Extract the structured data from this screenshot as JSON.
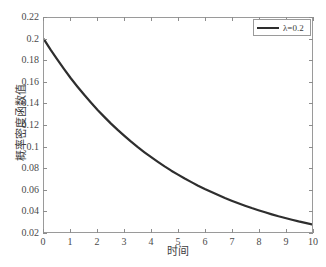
{
  "chart_data": {
    "type": "line",
    "title": "",
    "xlabel": "时间",
    "ylabel": "概率密度函数值",
    "xlim": [
      0,
      10
    ],
    "ylim": [
      0.02,
      0.22
    ],
    "grid": false,
    "legend_position": "top-right",
    "x_ticks": [
      "0",
      "1",
      "2",
      "3",
      "4",
      "5",
      "6",
      "7",
      "8",
      "9",
      "10"
    ],
    "y_ticks": [
      "0.02",
      "0.04",
      "0.06",
      "0.08",
      "0.1",
      "0.12",
      "0.14",
      "0.16",
      "0.18",
      "0.2",
      "0.22"
    ],
    "x_tick_values": [
      0,
      1,
      2,
      3,
      4,
      5,
      6,
      7,
      8,
      9,
      10
    ],
    "y_tick_values": [
      0.02,
      0.04,
      0.06,
      0.08,
      0.1,
      0.12,
      0.14,
      0.16,
      0.18,
      0.2,
      0.22
    ],
    "series": [
      {
        "name": "λ=0.2",
        "color": "#2e2e2e",
        "line_width": 2,
        "formula": "f(t) = 0.2 * exp(-0.2 * t)",
        "x": [
          0,
          0.25,
          0.5,
          0.75,
          1,
          1.25,
          1.5,
          1.75,
          2,
          2.25,
          2.5,
          2.75,
          3,
          3.25,
          3.5,
          3.75,
          4,
          4.25,
          4.5,
          4.75,
          5,
          5.25,
          5.5,
          5.75,
          6,
          6.25,
          6.5,
          6.75,
          7,
          7.25,
          7.5,
          7.75,
          8,
          8.25,
          8.5,
          8.75,
          9,
          9.25,
          9.5,
          9.75,
          10
        ],
        "values": [
          0.2,
          0.1902,
          0.181,
          0.1722,
          0.1637,
          0.1558,
          0.1482,
          0.141,
          0.1341,
          0.1276,
          0.1213,
          0.1154,
          0.1098,
          0.1044,
          0.0993,
          0.0945,
          0.0899,
          0.0855,
          0.0813,
          0.0773,
          0.0736,
          0.07,
          0.0666,
          0.0633,
          0.0602,
          0.0573,
          0.0545,
          0.0518,
          0.0493,
          0.0469,
          0.0446,
          0.0424,
          0.0404,
          0.0384,
          0.0365,
          0.0347,
          0.0331,
          0.0315,
          0.0299,
          0.0285,
          0.0271
        ]
      }
    ],
    "annotations": []
  },
  "legend": {
    "entries": [
      {
        "label": "λ=0.2",
        "color": "#2e2e2e"
      }
    ]
  },
  "axes": {
    "x_title": "时间",
    "y_title": "概率密度函数值"
  },
  "colors": {
    "curve": "#2e2e2e",
    "axis": "#9a9a9a",
    "tick": "#8d8d8d",
    "text": "#3a3a3a",
    "background": "#ffffff"
  }
}
